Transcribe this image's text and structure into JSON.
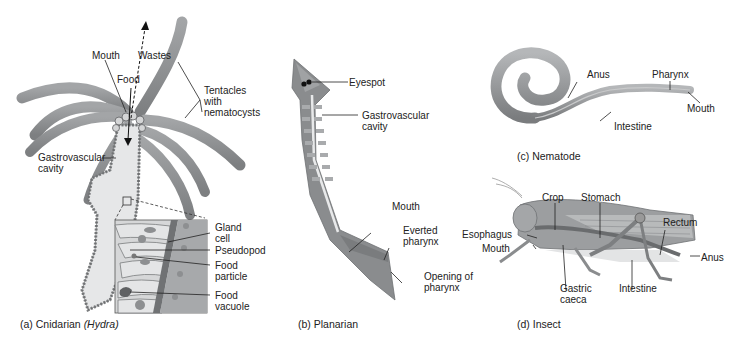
{
  "colors": {
    "body_fill": "#8a8c8e",
    "body_light": "#b9bbbd",
    "body_dark": "#6c6e70",
    "cavity_fill": "#e4e5e6",
    "background": "#ffffff",
    "label_line": "#222222"
  },
  "panels": {
    "cnidarian": {
      "caption_prefix": "(a) Cnidarian ",
      "caption_italic": "(Hydra)",
      "labels": {
        "mouth": "Mouth",
        "wastes": "Wastes",
        "food": "Food",
        "tentacles": "Tentacles",
        "tentacles_2": "with",
        "tentacles_3": "nematocysts",
        "gastrovascular": "Gastrovascular",
        "gastrovascular_2": "cavity",
        "gland_cell": "Gland",
        "gland_cell_2": "cell",
        "pseudopod": "Pseudopod",
        "food_particle": "Food",
        "food_particle_2": "particle",
        "food_vacuole": "Food",
        "food_vacuole_2": "vacuole"
      }
    },
    "planarian": {
      "caption": "(b) Planarian",
      "labels": {
        "eyespot": "Eyespot",
        "gastrovascular": "Gastrovascular",
        "gastrovascular_2": "cavity",
        "mouth": "Mouth",
        "everted_pharynx": "Everted",
        "everted_pharynx_2": "pharynx",
        "opening": "Opening of",
        "opening_2": "pharynx"
      }
    },
    "nematode": {
      "caption": "(c) Nematode",
      "labels": {
        "anus": "Anus",
        "pharynx": "Pharynx",
        "mouth": "Mouth",
        "intestine": "Intestine"
      }
    },
    "insect": {
      "caption": "(d) Insect",
      "labels": {
        "crop": "Crop",
        "stomach": "Stomach",
        "rectum": "Rectum",
        "esophagus": "Esophagus",
        "mouth": "Mouth",
        "anus": "Anus",
        "gastric": "Gastric",
        "gastric_2": "caeca",
        "intestine": "Intestine"
      }
    }
  }
}
